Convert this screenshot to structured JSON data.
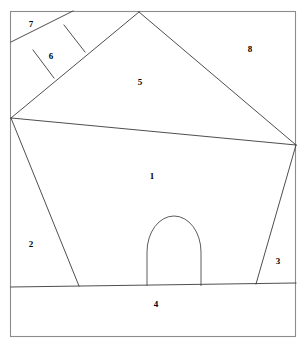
{
  "figure": {
    "width": 305,
    "height": 355,
    "background_color": "#ffffff",
    "line_color": "#3a3a3a",
    "frame_color": "#8c8c8c",
    "label_color": "#000000"
  },
  "frame": {
    "name": "outer-border",
    "x": 10,
    "y": 11,
    "width": 286,
    "height": 326
  },
  "vertices": {
    "left_hub": {
      "x": 11,
      "y": 118
    },
    "apex": {
      "x": 139,
      "y": 12
    },
    "right_hub": {
      "x": 296,
      "y": 145
    },
    "left_ground": {
      "x": 11,
      "y": 287
    },
    "right_ground": {
      "x": 296,
      "y": 283
    },
    "wall_left_base": {
      "x": 79,
      "y": 286
    },
    "wall_right_base": {
      "x": 256,
      "y": 284
    },
    "band_left_border": {
      "x": 11,
      "y": 42
    },
    "band_top_border": {
      "x": 73,
      "y": 11
    },
    "square_corner_left": {
      "x": 33,
      "y": 50
    },
    "square_corner_top": {
      "x": 64,
      "y": 25
    },
    "square_corner_right": {
      "x": 85,
      "y": 52
    },
    "square_corner_bottom": {
      "x": 54,
      "y": 78
    }
  },
  "edges": [
    {
      "name": "roof-left-edge",
      "from": "left_hub",
      "to": "apex"
    },
    {
      "name": "roof-right-edge",
      "from": "apex",
      "to": "right_hub"
    },
    {
      "name": "eave-line",
      "from": "left_hub",
      "to": "right_hub"
    },
    {
      "name": "wall-left-edge",
      "from": "left_hub",
      "to": "wall_left_base"
    },
    {
      "name": "wall-right-edge",
      "from": "right_hub",
      "to": "wall_right_base"
    },
    {
      "name": "ground-line",
      "from": "left_ground",
      "to": "right_ground"
    },
    {
      "name": "roof-band-outer",
      "from": "band_left_border",
      "to": "band_top_border"
    },
    {
      "name": "square-divider-left",
      "from": "square_corner_left",
      "to": "square_corner_bottom"
    },
    {
      "name": "square-divider-right",
      "from": "square_corner_top",
      "to": "square_corner_right"
    }
  ],
  "door": {
    "name": "arched-door",
    "left_x": 147,
    "right_x": 201,
    "base_y": 286,
    "arch_top_y": 216,
    "spring_y": 252
  },
  "labels": [
    {
      "id": "1",
      "text": "1",
      "x": 152,
      "y": 177,
      "region": "front-wall"
    },
    {
      "id": "2",
      "text": "2",
      "x": 31,
      "y": 245,
      "region": "left-side-wall"
    },
    {
      "id": "3",
      "text": "3",
      "x": 278,
      "y": 262,
      "region": "right-side-wall"
    },
    {
      "id": "4",
      "text": "4",
      "x": 156,
      "y": 305,
      "region": "foreground-ground"
    },
    {
      "id": "5",
      "text": "5",
      "x": 140,
      "y": 83,
      "region": "roof-front-face"
    },
    {
      "id": "6",
      "text": "6",
      "x": 51,
      "y": 57,
      "region": "chimney-square"
    },
    {
      "id": "7",
      "text": "7",
      "x": 31,
      "y": 25,
      "region": "upper-left-corner"
    },
    {
      "id": "8",
      "text": "8",
      "x": 250,
      "y": 50,
      "region": "sky-right"
    }
  ]
}
